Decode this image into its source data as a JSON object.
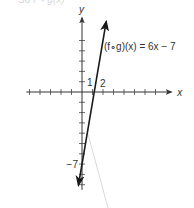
{
  "header_fragment": "So  f ∘ g(x)",
  "chart_data": {
    "type": "line",
    "title": "",
    "xlabel": "x",
    "ylabel": "y",
    "xlim": [
      -5.3,
      8.5
    ],
    "ylim": [
      -9.5,
      7.2
    ],
    "x_ticks": [
      -5,
      -4,
      -3,
      -2,
      -1,
      1,
      2,
      3,
      4,
      5,
      6,
      7
    ],
    "y_ticks": [
      -9,
      -8,
      -7,
      -6,
      -5,
      -4,
      -3,
      -2,
      -1,
      1,
      2,
      3,
      4,
      5
    ],
    "tick_labels": [
      {
        "axis": "y",
        "value": 1,
        "text": "1"
      },
      {
        "axis": "x",
        "value": 2,
        "text": "2"
      },
      {
        "axis": "y",
        "value": -7,
        "text": "−7"
      }
    ],
    "grid": false,
    "series": [
      {
        "name": "(f∘g)(x) = 6x − 7",
        "slope": 6,
        "intercept": -7,
        "x": [
          -0.33,
          2.3
        ],
        "y": [
          -9,
          6.8
        ],
        "color": "#1a1a1a"
      }
    ],
    "annotations": [
      {
        "text": "(f∘g)(x) = 6x − 7",
        "near": "top-right of line"
      }
    ]
  }
}
